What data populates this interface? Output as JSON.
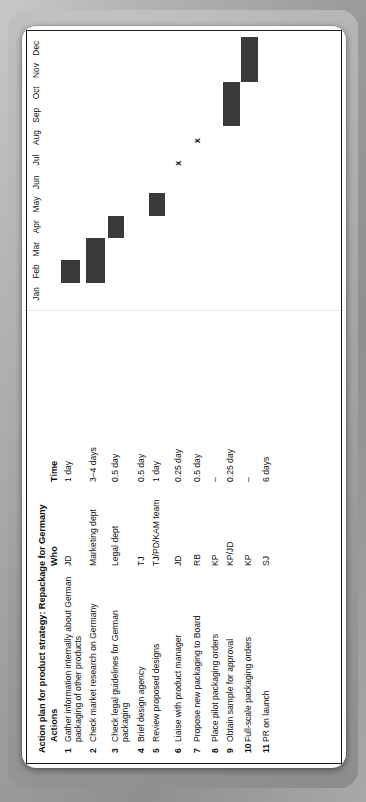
{
  "document": {
    "title": "Action plan for product strategy: Repackage for Germany",
    "columns": {
      "actions": "Actions",
      "who": "Who",
      "time": "Time"
    },
    "rows": [
      {
        "num": "1",
        "action": "Gather information internally about German packaging of other products",
        "who": "JD",
        "time": "1 day"
      },
      {
        "num": "2",
        "action": "Check market research on Germany",
        "who": "Marketing dept",
        "time": "3–4 days"
      },
      {
        "num": "3",
        "action": "Check legal guidelines for German packaging",
        "who": "Legal dept",
        "time": "0.5 day"
      },
      {
        "num": "4",
        "action": "Brief design agency",
        "who": "TJ",
        "time": "0.5 day"
      },
      {
        "num": "5",
        "action": "Review proposed designs",
        "who": "TJ/PD/KAM team",
        "time": "1 day"
      },
      {
        "num": "6",
        "action": "Liaise with product manager",
        "who": "JD",
        "time": "0.25 day"
      },
      {
        "num": "7",
        "action": "Propose new packaging to Board",
        "who": "RB",
        "time": "0.5 day"
      },
      {
        "num": "8",
        "action": "Place pilot packaging orders",
        "who": "KP",
        "time": "–"
      },
      {
        "num": "9",
        "action": "Obtain sample for approval",
        "who": "KP/JD",
        "time": "0.25 day"
      },
      {
        "num": "10",
        "action": "Full-scale packaging orders",
        "who": "KP",
        "time": "–"
      },
      {
        "num": "11",
        "action": "PR on launch",
        "who": "SJ",
        "time": "6 days"
      }
    ]
  },
  "chart_data": {
    "type": "bar",
    "chart_kind": "gantt",
    "title": "Action plan for product strategy: Repackage for Germany",
    "xlabel": "",
    "ylabel": "",
    "grid": false,
    "legend": null,
    "categories": [
      "Jan",
      "Feb",
      "Mar",
      "Apr",
      "May",
      "Jun",
      "Jul",
      "Aug",
      "Sep",
      "Oct",
      "Nov",
      "Dec"
    ],
    "xlim": [
      0,
      12
    ],
    "bar_color": "#3a3a3a",
    "tasks": [
      {
        "num": "1",
        "label": "Gather information internally about German packaging of other products",
        "start_month": 1,
        "end_month": 2,
        "marker": null
      },
      {
        "num": "2",
        "label": "Check market research on Germany",
        "start_month": 1,
        "end_month": 3,
        "marker": null
      },
      {
        "num": "3",
        "label": "Check legal guidelines for German packaging",
        "start_month": 3,
        "end_month": 4,
        "marker": null
      },
      {
        "num": "4",
        "label": "Brief design agency",
        "start_month": 0,
        "end_month": 0,
        "marker": null
      },
      {
        "num": "5",
        "label": "Review proposed designs",
        "start_month": 4,
        "end_month": 5,
        "marker": null
      },
      {
        "num": "6",
        "label": "Liaise with product manager",
        "start_month": 0,
        "end_month": 0,
        "marker": "x",
        "marker_month": 6
      },
      {
        "num": "7",
        "label": "Propose new packaging to Board",
        "start_month": 0,
        "end_month": 0,
        "marker": "x",
        "marker_month": 7
      },
      {
        "num": "8",
        "label": "Place pilot packaging orders",
        "start_month": 0,
        "end_month": 0,
        "marker": null
      },
      {
        "num": "9",
        "label": "Obtain sample for approval",
        "start_month": 8,
        "end_month": 10,
        "marker": null
      },
      {
        "num": "10",
        "label": "Full-scale packaging orders",
        "start_month": 10,
        "end_month": 12,
        "marker": null
      },
      {
        "num": "11",
        "label": "PR on launch",
        "start_month": 0,
        "end_month": 0,
        "marker": null
      }
    ]
  }
}
